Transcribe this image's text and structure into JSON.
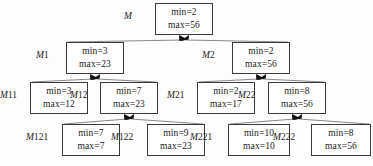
{
  "diagram": {
    "style": {
      "box_border_color": "#3a3a3a",
      "edge_color": "#555555",
      "arrow_color": "#111111",
      "background": "#fdfdfd",
      "text_color": "#1a1a1a"
    },
    "nodes": [
      {
        "id": "M",
        "label_m": "M",
        "label_index": "",
        "min_text": "min=2",
        "max_text": "max=56",
        "min": 2,
        "max": 56,
        "box": {
          "x": 155,
          "y": 3,
          "w": 58,
          "h": 32
        },
        "label": {
          "x": 124,
          "y": 11
        },
        "level": 0,
        "parent": null
      },
      {
        "id": "M1",
        "label_m": "M",
        "label_index": "1",
        "min_text": "min=3",
        "max_text": "max=23",
        "min": 3,
        "max": 23,
        "box": {
          "x": 66,
          "y": 42,
          "w": 58,
          "h": 32
        },
        "label": {
          "x": 36,
          "y": 50
        },
        "level": 1,
        "parent": "M"
      },
      {
        "id": "M2",
        "label_m": "M",
        "label_index": "2",
        "min_text": "min=2",
        "max_text": "max=56",
        "min": 2,
        "max": 56,
        "box": {
          "x": 232,
          "y": 42,
          "w": 58,
          "h": 32
        },
        "label": {
          "x": 202,
          "y": 50
        },
        "level": 1,
        "parent": "M"
      },
      {
        "id": "M11",
        "label_m": "M",
        "label_index": "11",
        "min_text": "min=3",
        "max_text": "max=12",
        "min": 3,
        "max": 12,
        "box": {
          "x": 30,
          "y": 82,
          "w": 58,
          "h": 32
        },
        "label": {
          "x": 0,
          "y": 90
        },
        "level": 2,
        "parent": "M1"
      },
      {
        "id": "M12",
        "label_m": "M",
        "label_index": "12",
        "min_text": "min=7",
        "max_text": "max=23",
        "min": 7,
        "max": 23,
        "box": {
          "x": 100,
          "y": 82,
          "w": 58,
          "h": 32
        },
        "label": {
          "x": 70,
          "y": 90
        },
        "level": 2,
        "parent": "M1"
      },
      {
        "id": "M21",
        "label_m": "M",
        "label_index": "21",
        "min_text": "min=2",
        "max_text": "max=17",
        "min": 2,
        "max": 17,
        "box": {
          "x": 197,
          "y": 82,
          "w": 58,
          "h": 32
        },
        "label": {
          "x": 167,
          "y": 90
        },
        "level": 2,
        "parent": "M2"
      },
      {
        "id": "M22",
        "label_m": "M",
        "label_index": "22",
        "min_text": "min=8",
        "max_text": "max=56",
        "min": 8,
        "max": 56,
        "box": {
          "x": 268,
          "y": 82,
          "w": 58,
          "h": 32
        },
        "label": {
          "x": 238,
          "y": 90
        },
        "level": 2,
        "parent": "M2"
      },
      {
        "id": "M121",
        "label_m": "M",
        "label_index": "121",
        "min_text": "min=7",
        "max_text": "max=7",
        "min": 7,
        "max": 7,
        "box": {
          "x": 62,
          "y": 124,
          "w": 58,
          "h": 32
        },
        "label": {
          "x": 26,
          "y": 132
        },
        "level": 3,
        "parent": "M12"
      },
      {
        "id": "M122",
        "label_m": "M",
        "label_index": "122",
        "min_text": "min=9",
        "max_text": "max=23",
        "min": 9,
        "max": 23,
        "box": {
          "x": 147,
          "y": 124,
          "w": 58,
          "h": 32
        },
        "label": {
          "x": 111,
          "y": 132
        },
        "level": 3,
        "parent": "M12"
      },
      {
        "id": "M221",
        "label_m": "M",
        "label_index": "221",
        "min_text": "min=10",
        "max_text": "max=10",
        "min": 10,
        "max": 10,
        "box": {
          "x": 228,
          "y": 124,
          "w": 62,
          "h": 32
        },
        "label": {
          "x": 190,
          "y": 132
        },
        "level": 3,
        "parent": "M22"
      },
      {
        "id": "M222",
        "label_m": "M",
        "label_index": "222",
        "min_text": "min=8",
        "max_text": "max=56",
        "min": 8,
        "max": 56,
        "box": {
          "x": 311,
          "y": 124,
          "w": 60,
          "h": 32
        },
        "label": {
          "x": 273,
          "y": 132
        },
        "level": 3,
        "parent": "M22"
      }
    ],
    "edges": [
      {
        "from": "M1",
        "to": "M",
        "arrow_at": "parent"
      },
      {
        "from": "M2",
        "to": "M",
        "arrow_at": "parent"
      },
      {
        "from": "M11",
        "to": "M1",
        "arrow_at": "parent"
      },
      {
        "from": "M12",
        "to": "M1",
        "arrow_at": "parent"
      },
      {
        "from": "M21",
        "to": "M2",
        "arrow_at": "parent"
      },
      {
        "from": "M22",
        "to": "M2",
        "arrow_at": "parent"
      },
      {
        "from": "M121",
        "to": "M12",
        "arrow_at": "parent"
      },
      {
        "from": "M122",
        "to": "M12",
        "arrow_at": "parent"
      },
      {
        "from": "M221",
        "to": "M22",
        "arrow_at": "parent"
      },
      {
        "from": "M222",
        "to": "M22",
        "arrow_at": "parent"
      }
    ]
  }
}
